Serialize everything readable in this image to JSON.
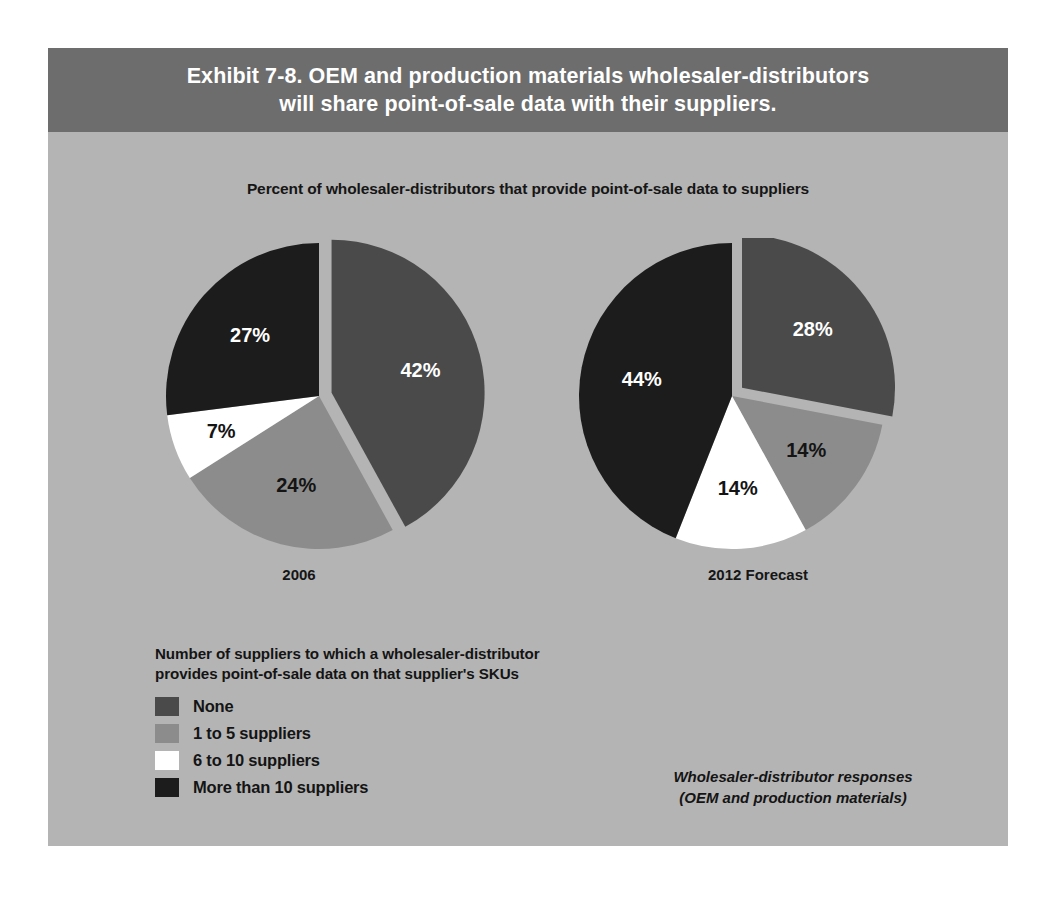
{
  "exhibit": {
    "title_lines": [
      "Exhibit 7-8. OEM and production materials wholesaler-distributors",
      "will share point-of-sale data with their suppliers."
    ],
    "subtitle": "Percent of wholesaler-distributors that provide point-of-sale data to suppliers",
    "panel_background": "#b4b4b4",
    "title_band_background": "#6d6d6d",
    "title_color": "#ffffff"
  },
  "legend": {
    "title_lines": [
      "Number of suppliers to which a wholesaler-distributor",
      "provides point-of-sale data on that supplier's SKUs"
    ],
    "items": [
      {
        "label": "None",
        "color": "#4a4a4a"
      },
      {
        "label": "1 to 5 suppliers",
        "color": "#8c8c8c"
      },
      {
        "label": "6 to 10 suppliers",
        "color": "#ffffff"
      },
      {
        "label": "More than 10 suppliers",
        "color": "#1c1c1c"
      }
    ]
  },
  "source_note_lines": [
    "Wholesaler-distributor responses",
    "(OEM and production materials)"
  ],
  "chart_data": {
    "type": "pie",
    "title": "Exhibit 7-8. OEM and production materials wholesaler-distributors will share point-of-sale data with their suppliers.",
    "subtitle": "Percent of wholesaler-distributors that provide point-of-sale data to suppliers",
    "legend_title": "Number of suppliers to which a wholesaler-distributor provides point-of-sale data on that supplier's SKUs",
    "legend_position": "bottom-left",
    "units": "percent",
    "categories": [
      "None",
      "1 to 5 suppliers",
      "6 to 10 suppliers",
      "More than 10 suppliers"
    ],
    "colors": [
      "#4a4a4a",
      "#8c8c8c",
      "#ffffff",
      "#1c1c1c"
    ],
    "annotation": "Wholesaler-distributor responses (OEM and production materials)",
    "charts": [
      {
        "name": "2006",
        "caption": "2006",
        "values": [
          42,
          24,
          7,
          27
        ],
        "labels": [
          "42%",
          "24%",
          "7%",
          "27%"
        ],
        "label_colors": [
          "#ffffff",
          "#141414",
          "#141414",
          "#ffffff"
        ],
        "exploded_slice": "None"
      },
      {
        "name": "2012 Forecast",
        "caption": "2012 Forecast",
        "values": [
          28,
          14,
          14,
          44
        ],
        "labels": [
          "28%",
          "14%",
          "14%",
          "44%"
        ],
        "label_colors": [
          "#ffffff",
          "#141414",
          "#141414",
          "#ffffff"
        ],
        "exploded_slice": "None"
      }
    ]
  }
}
